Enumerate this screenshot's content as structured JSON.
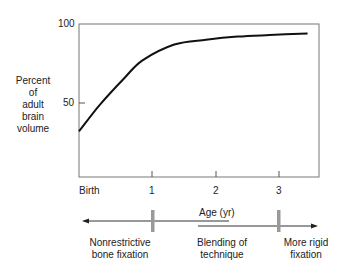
{
  "chart_data": {
    "type": "line",
    "title": "",
    "xlabel": "Age (yr)",
    "ylabel": "Percent of adult brain volume",
    "ylabel_lines": [
      "Percent",
      "of",
      "adult",
      "brain",
      "volume"
    ],
    "x_tick_labels": [
      "Birth",
      "1",
      "2",
      "3"
    ],
    "y_tick_labels": [
      "50",
      "100"
    ],
    "xlim": [
      0,
      3.6
    ],
    "ylim": [
      0,
      100
    ],
    "grid": false,
    "series": [
      {
        "name": "Brain volume",
        "x": [
          0,
          0.33,
          0.72,
          1.0,
          1.5,
          2.0,
          2.5,
          3.0,
          3.6
        ],
        "y": [
          32,
          49,
          66,
          77,
          87,
          90,
          92,
          93,
          94
        ]
      }
    ],
    "annotations": {
      "left_arrow_label": "Nonrestrictive bone fixation",
      "left_arrow_label_lines": [
        "Nonrestrictive",
        "bone fixation"
      ],
      "middle_label_lines": [
        "Blending of",
        "technique"
      ],
      "right_arrow_label_lines": [
        "More rigid",
        "fixation"
      ],
      "marker_positions_yr": [
        1,
        3
      ]
    }
  },
  "labels": {
    "y100": "100",
    "y50": "50",
    "ylabel": [
      "Percent",
      "of",
      "adult",
      "brain",
      "volume"
    ],
    "x": [
      "Birth",
      "1",
      "2",
      "3"
    ],
    "age": "Age (yr)",
    "left": [
      "Nonrestrictive",
      "bone fixation"
    ],
    "middle": [
      "Blending of",
      "technique"
    ],
    "right": [
      "More rigid",
      "fixation"
    ]
  }
}
